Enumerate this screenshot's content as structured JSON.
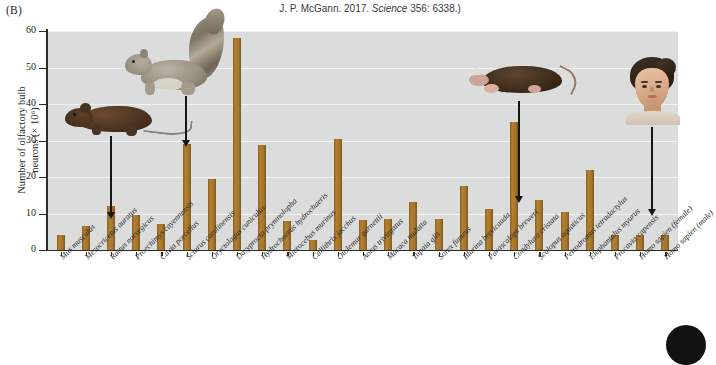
{
  "panel": {
    "letter": "(B)"
  },
  "citation": {
    "prefix": "J. P. McGann. 2017. ",
    "journal": "Science",
    "suffix": " 356: 6338.)"
  },
  "axes": {
    "y_title_line1": "Number of olfactory bulb",
    "y_title_line2": "neurons (× 10⁶)",
    "y_ticks": [
      "0",
      "10",
      "20",
      "30",
      "40",
      "50",
      "60"
    ]
  },
  "annotations": [
    {
      "name": "rat-photo",
      "species": "Rattus norvegicus"
    },
    {
      "name": "squirrel-photo",
      "species": "Sciurus carolinensis"
    },
    {
      "name": "mole-photo",
      "species": "Condylura cristata"
    },
    {
      "name": "human-photo",
      "species": "Homo sapien (female)"
    }
  ],
  "chart_data": {
    "type": "bar",
    "title": "",
    "xlabel": "",
    "ylabel": "Number of olfactory bulb neurons (× 10⁶)",
    "ylim": [
      0,
      60
    ],
    "ytick_step": 10,
    "grid": true,
    "legend": "none",
    "bar_color": "#a8762b",
    "plot_background": "#dbdcdc",
    "categories": [
      "Mus musculus",
      "Mesocricetus auratus",
      "Rattus norvegicus",
      "Proechimys cayennensis",
      "Cavia porcellus",
      "Sciurus carolinensis",
      "Oryctolagus cuniculus",
      "Dasyprocta prymnolopha",
      "Hydrochoerus hydrochaeris",
      "Microcebus murinus",
      "Callithrix jacchus",
      "Otolemur garnettii",
      "Aotus trivirgatus",
      "Macaca mulatta",
      "Tupaia glis",
      "Sorex fumeus",
      "Blarina brevicauda",
      "Parascalops breweri",
      "Condylura cristata",
      "Scalopus aquaticus",
      "Petrodromus tetradactylus",
      "Elephantulus myurus",
      "Procavia capensis",
      "Homo sapien (female)",
      "Homo sapien (male)"
    ],
    "values": [
      4.2,
      6.5,
      12.0,
      9.5,
      7.0,
      29.0,
      19.5,
      58.0,
      28.8,
      8.0,
      2.8,
      30.3,
      8.2,
      8.5,
      13.2,
      8.5,
      17.5,
      11.2,
      35.2,
      13.8,
      10.5,
      22.0,
      4.2,
      4.2,
      4.2
    ]
  }
}
